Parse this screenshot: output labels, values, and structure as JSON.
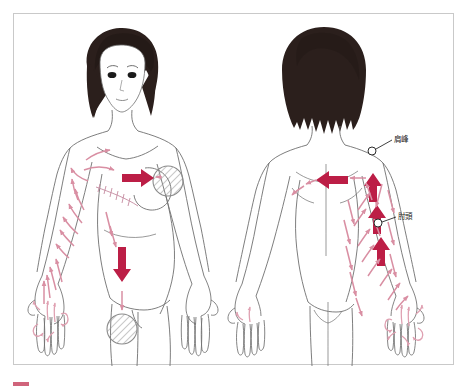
{
  "figure": {
    "background_color": "#ffffff",
    "frame_border_color": "#c9c9c9",
    "views": [
      {
        "id": "anterior",
        "name": "front view female torso"
      },
      {
        "id": "posterior",
        "name": "back view female torso"
      }
    ],
    "colors": {
      "body_outline": "#6f6f6f",
      "hair": "#2b1f1c",
      "major_arrow": "#bc1e46",
      "minor_arrow": "#d98fa3",
      "hatch_circle_stroke": "#8a8a8a",
      "hatch_line": "#9a9a9a",
      "label_text": "#1c1c1c",
      "leader_line": "#2b2b2b"
    },
    "labels": [
      {
        "id": "acromion",
        "text": "肩峰",
        "view": "posterior"
      },
      {
        "id": "olecranon",
        "text": "肘頭",
        "view": "posterior"
      }
    ],
    "markers": [
      {
        "id": "chest-node",
        "shape": "hatched-circle",
        "view": "anterior",
        "region": "right chest / axilla"
      },
      {
        "id": "inguinal-node",
        "shape": "hatched-circle",
        "view": "anterior",
        "region": "left inguinal"
      },
      {
        "id": "acromion-point",
        "shape": "small-open-circle",
        "view": "posterior"
      },
      {
        "id": "olecranon-point",
        "shape": "small-open-circle",
        "view": "posterior"
      }
    ],
    "flow_arrows": {
      "major": [
        {
          "view": "anterior",
          "direction": "right",
          "region": "upper chest toward axilla"
        },
        {
          "view": "anterior",
          "direction": "down",
          "region": "flank toward inguinal"
        },
        {
          "view": "posterior",
          "direction": "left",
          "region": "upper back toward opposite axilla"
        },
        {
          "view": "posterior",
          "direction": "up",
          "region": "upper arm lower segment"
        },
        {
          "view": "posterior",
          "direction": "up",
          "region": "upper arm mid segment"
        },
        {
          "view": "posterior",
          "direction": "up",
          "region": "upper arm proximal segment"
        }
      ],
      "minor_description": "many small pink directional arrows over arm, forearm, hand, chest and back"
    }
  },
  "caption": {
    "marker_color": "#c0304f",
    "text": ""
  }
}
